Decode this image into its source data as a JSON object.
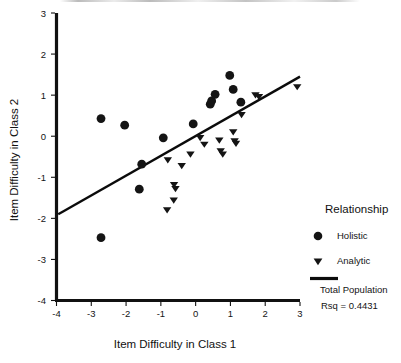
{
  "figure": {
    "background": "#ffffff",
    "ink_color": "#141414"
  },
  "axes": {
    "x_title": "Item Difficulty in Class 1",
    "y_title": "Item Difficulty in Class 2",
    "x_ticks": [
      "-4",
      "-3",
      "-2",
      "-1",
      "0",
      "1",
      "2",
      "3"
    ],
    "y_ticks": [
      "3",
      "2",
      "1",
      "0",
      "-1",
      "-2",
      "-3",
      "-4"
    ]
  },
  "legend": {
    "title": "Relationship",
    "items": [
      {
        "label": "Holistic",
        "marker": "circle"
      },
      {
        "label": "Analytic",
        "marker": "triangle-down"
      }
    ],
    "line_caption": "Total Population",
    "rsq_caption": "Rsq = 0.4431"
  },
  "chart_data": {
    "type": "scatter",
    "title": "",
    "xlabel": "Item Difficulty in Class 1",
    "ylabel": "Item Difficulty in Class 2",
    "xlim": [
      -4,
      3
    ],
    "ylim": [
      -4,
      3
    ],
    "xticks": [
      -4,
      -3,
      -2,
      -1,
      0,
      1,
      2,
      3
    ],
    "yticks": [
      -4,
      -3,
      -2,
      -1,
      0,
      1,
      2,
      3
    ],
    "grid": false,
    "legend_position": "right",
    "series": [
      {
        "name": "Holistic",
        "marker": "circle",
        "color": "#141414",
        "points": [
          [
            -2.72,
            0.43
          ],
          [
            -2.72,
            -2.47
          ],
          [
            -2.04,
            0.27
          ],
          [
            -1.55,
            -0.68
          ],
          [
            -1.62,
            -1.29
          ],
          [
            -0.93,
            -0.04
          ],
          [
            -0.07,
            0.3
          ],
          [
            0.42,
            0.78
          ],
          [
            0.46,
            0.86
          ],
          [
            0.56,
            1.02
          ],
          [
            0.98,
            1.48
          ],
          [
            1.08,
            1.14
          ],
          [
            1.3,
            0.83
          ]
        ]
      },
      {
        "name": "Analytic",
        "marker": "triangle-down",
        "color": "#141414",
        "points": [
          [
            -0.8,
            -0.58
          ],
          [
            -0.62,
            -1.18
          ],
          [
            -0.58,
            -1.28
          ],
          [
            -0.63,
            -1.56
          ],
          [
            -0.82,
            -1.8
          ],
          [
            -0.4,
            -0.72
          ],
          [
            -0.15,
            -0.44
          ],
          [
            0.13,
            -0.04
          ],
          [
            0.25,
            -0.2
          ],
          [
            0.68,
            -0.1
          ],
          [
            0.72,
            -0.36
          ],
          [
            0.78,
            -0.44
          ],
          [
            1.08,
            0.1
          ],
          [
            1.12,
            -0.12
          ],
          [
            1.16,
            -0.18
          ],
          [
            1.32,
            0.52
          ],
          [
            1.72,
            1.0
          ],
          [
            1.82,
            0.96
          ],
          [
            2.92,
            1.2
          ]
        ]
      }
    ],
    "fit_line": {
      "name": "Total Population",
      "rsq": 0.4431,
      "x_start": -3.95,
      "y_start": -1.9,
      "x_end": 3.0,
      "y_end": 1.45
    }
  }
}
